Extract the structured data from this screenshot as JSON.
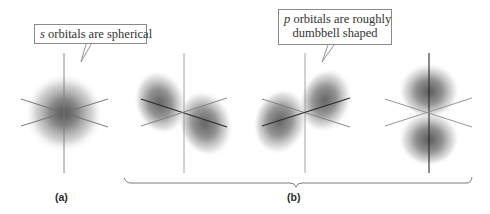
{
  "figure": {
    "callouts": [
      {
        "id": "s",
        "italic_letter": "s",
        "text": " orbitals are spherical"
      },
      {
        "id": "p",
        "italic_letter": "p",
        "line1_rest": " orbitals are roughly",
        "line2": "dumbbell shaped"
      }
    ],
    "labels": {
      "a": "(a)",
      "b": "(b)"
    },
    "orbitals": [
      {
        "name": "s-orbital",
        "type": "s",
        "center": [
          64,
          113
        ],
        "panel": "a"
      },
      {
        "name": "p-orbital-1",
        "type": "p",
        "orientation": "diagonal-front-left-back-right",
        "center": [
          184,
          112
        ],
        "panel": "b"
      },
      {
        "name": "p-orbital-2",
        "type": "p",
        "orientation": "diagonal-front-right-back-left",
        "center": [
          305,
          112
        ],
        "panel": "b"
      },
      {
        "name": "p-orbital-3",
        "type": "p",
        "orientation": "vertical",
        "center": [
          429,
          112
        ],
        "panel": "b"
      }
    ],
    "colors": {
      "axis": "#7a7a7a",
      "axis_dark": "#2a2a2a",
      "lobe_core": "#5a5a5a",
      "callout_border": "#8a8a8a",
      "text": "#333333"
    }
  }
}
